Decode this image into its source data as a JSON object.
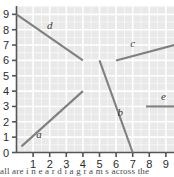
{
  "chart_data": {
    "type": "line",
    "title": "",
    "xlabel": "",
    "ylabel": "",
    "xlim": [
      0,
      9.6
    ],
    "ylim": [
      0,
      9.6
    ],
    "xticks": [
      1,
      2,
      3,
      4,
      5,
      6,
      7,
      8,
      9
    ],
    "yticks": [
      0,
      1,
      2,
      3,
      4,
      5,
      6,
      7,
      8,
      9
    ],
    "xtick_labels": [
      "1",
      "2",
      "3",
      "4",
      "5",
      "6",
      "7",
      "8",
      "9"
    ],
    "ytick_labels": [
      "0",
      "1",
      "2",
      "3",
      "4",
      "5",
      "6",
      "7",
      "8",
      "9"
    ],
    "grid": true,
    "legend": "inline-labels",
    "series": [
      {
        "name": "a",
        "label": "a",
        "x": [
          0.3,
          4.0
        ],
        "y": [
          0.4,
          4.0
        ],
        "label_x": 1.35,
        "label_y": 0.95,
        "slope": 0.97,
        "color": "#808080"
      },
      {
        "name": "b",
        "label": "b",
        "x": [
          5.0,
          7.0
        ],
        "y": [
          6.0,
          0.0
        ],
        "label_x": 6.25,
        "label_y": 2.35,
        "slope": -3.0,
        "color": "#808080"
      },
      {
        "name": "c",
        "label": "c",
        "x": [
          6.0,
          9.5
        ],
        "y": [
          6.0,
          7.0
        ],
        "label_x": 7.0,
        "label_y": 6.85,
        "slope": 0.286,
        "color": "#808080"
      },
      {
        "name": "d",
        "label": "d",
        "x": [
          0.0,
          4.0
        ],
        "y": [
          9.0,
          6.0
        ],
        "label_x": 2.0,
        "label_y": 8.05,
        "slope": -0.75,
        "color": "#808080"
      },
      {
        "name": "e",
        "label": "e",
        "x": [
          7.8,
          9.6
        ],
        "y": [
          3.0,
          3.0
        ],
        "label_x": 8.85,
        "label_y": 3.45,
        "slope": 0.0,
        "color": "#808080"
      }
    ]
  },
  "style": {
    "plot_background": "#e9e9e9",
    "gridline_color": "#ffffff",
    "axis_color": "#555555",
    "line_color": "#808080",
    "label_color": "#3a3a3a",
    "tick_label_color": "#2b2b2b"
  },
  "caption": {
    "text": "all are  i n e a r  d i a g r a m s      across  the"
  }
}
